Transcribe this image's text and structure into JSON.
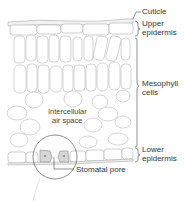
{
  "diagram": {
    "labels": {
      "cuticle": "Cuticle",
      "upper_epidermis_1": "Upper",
      "upper_epidermis_2": "epidermis",
      "mesophyll_1": "Mesophyll",
      "mesophyll_2": "cells",
      "intercellular_1": "Intercellular",
      "intercellular_2": "air space",
      "lower_epidermis_1": "Lower",
      "lower_epidermis_2": "epidermis",
      "stomatal_pore": "Stomatal pore"
    },
    "colors": {
      "cell_stroke": "#b8b8b8",
      "guard_cell_fill": "#d6d6d6",
      "label_text": "#333333",
      "leader_line": "#444444"
    }
  }
}
